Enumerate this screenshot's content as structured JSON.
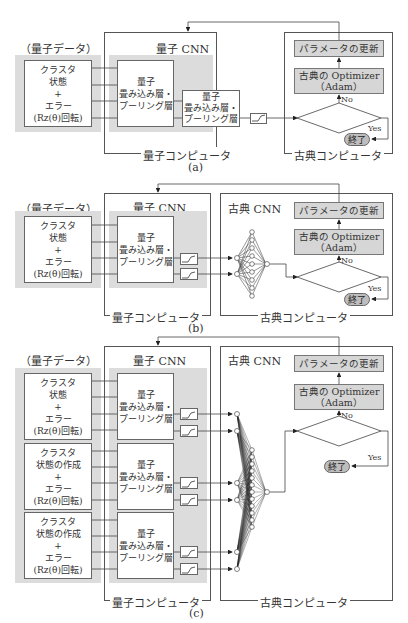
{
  "panels": [
    {
      "id": "a",
      "caption": "(a)",
      "quantum_data_title": "（量子データ）",
      "quantum_data_box": [
        "クラスタ",
        "状態",
        "+",
        "エラー",
        "(Rz(θ)回転)"
      ],
      "quantum_cnn_title": "量子 CNN",
      "qconv_layers": [
        [
          "量子",
          "畳み込み層・",
          "プーリング層"
        ],
        [
          "量子",
          "畳み込み層・",
          "プーリング層"
        ]
      ],
      "quantum_computer_label": "量子コンピュータ",
      "classical_computer_label": "古典コンピュータ",
      "update_box": "パラメータの更新",
      "optimizer_box": [
        "古典の Optimizer",
        "（Adam）"
      ],
      "loss": "損失関数",
      "no": "No",
      "yes": "Yes",
      "end": "終了"
    },
    {
      "id": "b",
      "caption": "(b)",
      "quantum_data_title": "（量子データ）",
      "quantum_data_box": [
        "クラスタ",
        "状態",
        "+",
        "エラー",
        "(Rz(θ)回転)"
      ],
      "quantum_cnn_title": "量子 CNN",
      "qconv_layers": [
        [
          "量子",
          "畳み込み層・",
          "プーリング層"
        ]
      ],
      "classical_cnn_title": "古典 CNN",
      "quantum_computer_label": "量子コンピュータ",
      "classical_computer_label": "古典コンピュータ",
      "update_box": "パラメータの更新",
      "optimizer_box": [
        "古典の Optimizer",
        "（Adam）"
      ],
      "loss": "損失関数",
      "no": "No",
      "yes": "Yes",
      "end": "終了"
    },
    {
      "id": "c",
      "caption": "(c)",
      "quantum_data_title": "（量子データ）",
      "quantum_data_boxes": [
        [
          "クラスタ",
          "状態",
          "+",
          "エラー",
          "(Rz(θ)回転)"
        ],
        [
          "クラスタ",
          "状態の作成",
          "+",
          "エラー",
          "(Rz(θ)回転)"
        ],
        [
          "クラスタ",
          "状態の作成",
          "+",
          "エラー",
          "(Rz(θ)回転)"
        ]
      ],
      "quantum_cnn_title": "量子 CNN",
      "qconv_layers": [
        [
          "量子",
          "畳み込み層・",
          "プーリング層"
        ],
        [
          "量子",
          "畳み込み層・",
          "プーリング層"
        ],
        [
          "量子",
          "畳み込み層・",
          "プーリング層"
        ]
      ],
      "classical_cnn_title": "古典 CNN",
      "quantum_computer_label": "量子コンピュータ",
      "classical_computer_label": "古典コンピュータ",
      "update_box": "パラメータの更新",
      "optimizer_box": [
        "古典の Optimizer",
        "（Adam）"
      ],
      "loss": "損失関数",
      "no": "No",
      "yes": "Yes",
      "end": "終了"
    }
  ]
}
